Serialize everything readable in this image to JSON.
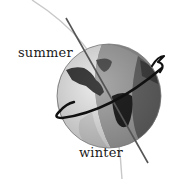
{
  "diagram": {
    "type": "earth-axial-tilt",
    "labels": {
      "summer": "summer",
      "winter": "winter"
    },
    "elements": {
      "globe": "earth-globe",
      "axis": "tilted-rotation-axis",
      "rotation_arrow": "rotation-direction-arrow",
      "orbit_path": "orbit-arc"
    },
    "colors": {
      "orbit": "#c8c8c8",
      "axis": "#555555",
      "arrow": "#111111",
      "globe_light": "#e8e8e8",
      "globe_mid": "#9a9a9a",
      "globe_dark": "#5e5e5e",
      "land_dark": "#2a2a2a"
    }
  }
}
